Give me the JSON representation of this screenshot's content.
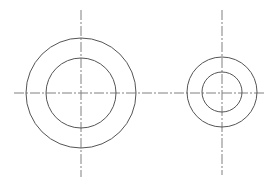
{
  "diagram": {
    "type": "technical-drawing",
    "colors": {
      "background": "#ffffff",
      "outline": "#555555",
      "centerline": "#808080"
    },
    "shared_horizontal_centerline": {
      "x1": 14,
      "x2": 265,
      "y": 93
    },
    "features": [
      {
        "id": "large-ring",
        "cx": 81,
        "cy": 93,
        "outer_r": 55,
        "inner_r": 35,
        "vertical_centerline": {
          "y1": 10,
          "y2": 177
        }
      },
      {
        "id": "small-ring",
        "cx": 222,
        "cy": 92,
        "outer_r": 35,
        "inner_r": 20,
        "vertical_centerline": {
          "y1": 10,
          "y2": 175
        }
      }
    ]
  }
}
